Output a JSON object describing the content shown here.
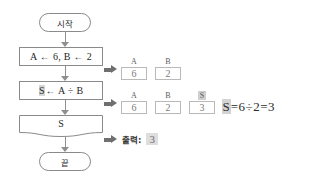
{
  "diagram": {
    "colors": {
      "stroke": "#8a8a8a",
      "connector": "#8f8f8f",
      "arrow": "#6f6f6f",
      "highlight": "#d3d3d3",
      "cell_border": "#b9b9b9",
      "text": "#1f1f1f",
      "background": "#ffffff"
    },
    "flow": {
      "start": {
        "label": "시작"
      },
      "init": {
        "text": "A ← 6, B ← 2"
      },
      "compute": {
        "highlighted": "S",
        "rest": "← A ÷ B"
      },
      "output": {
        "label": "S"
      },
      "end": {
        "label": "끝"
      }
    },
    "traces": [
      {
        "name": "trace-after-init",
        "cells": [
          {
            "var": "A",
            "value": "6",
            "highlight": false
          },
          {
            "var": "B",
            "value": "2",
            "highlight": false
          }
        ]
      },
      {
        "name": "trace-after-compute",
        "cells": [
          {
            "var": "A",
            "value": "6",
            "highlight": false
          },
          {
            "var": "B",
            "value": "2",
            "highlight": false
          },
          {
            "var": "S",
            "value": "3",
            "highlight": true
          }
        ]
      }
    ],
    "equation": {
      "lhs": "S",
      "rest": "=6÷2=3"
    },
    "output_line": {
      "label": "출력:",
      "value": "3"
    },
    "icons": {
      "flow_arrow": "arrow-down-icon",
      "callout_arrow": "arrow-right-icon"
    }
  }
}
